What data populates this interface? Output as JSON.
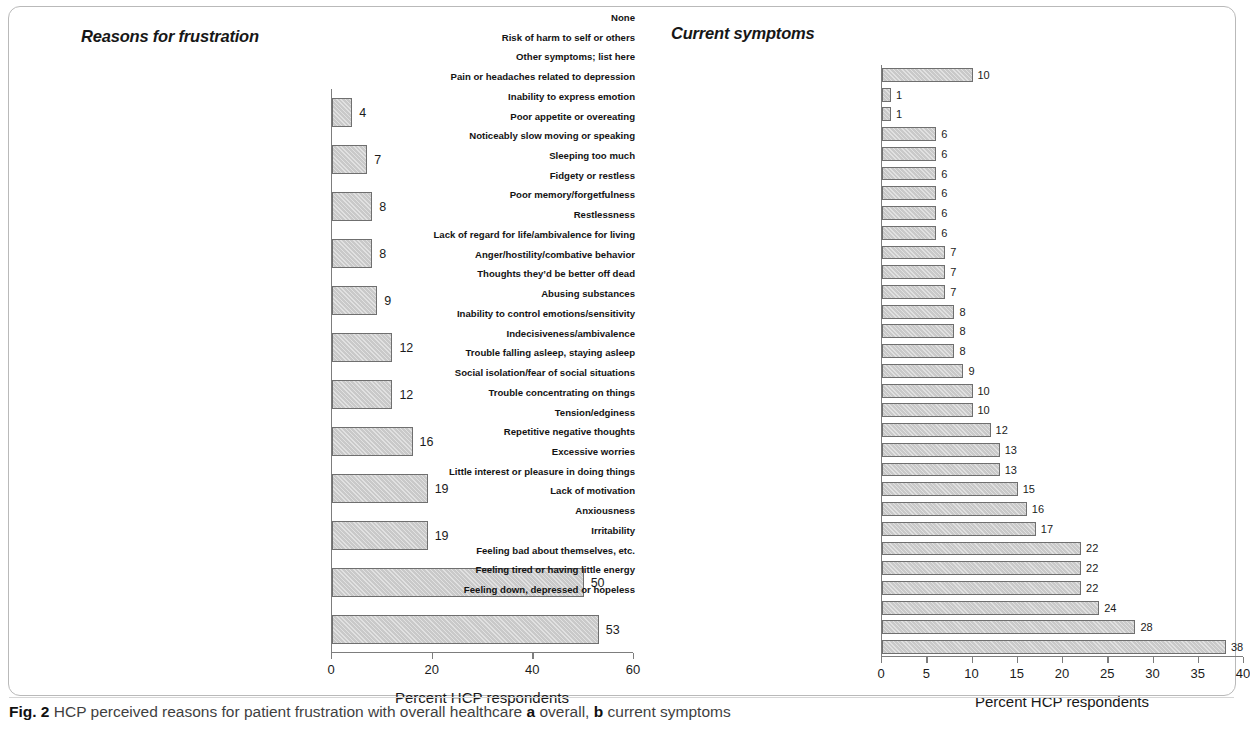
{
  "figure": {
    "caption_number": "Fig. 2",
    "caption_text": "HCP perceived reasons for patient frustration with overall healthcare",
    "caption_sub_a": "a",
    "caption_sub_a_text": "overall,",
    "caption_sub_b": "b",
    "caption_sub_b_text": "current symptoms"
  },
  "chart_data": [
    {
      "type": "bar",
      "orientation": "horizontal",
      "panel": "a",
      "title": "Reasons for frustration",
      "xlabel": "Percent HCP respondents",
      "ylabel": "",
      "xlim": [
        0,
        60
      ],
      "xticks": [
        0,
        20,
        40,
        60
      ],
      "grid": false,
      "legend": "none",
      "bar_color": "#c9c9c9",
      "bar_border_color": "#6f6f6f",
      "categories": [
        "Other",
        "Not being able to get their treatment",
        "Length of time until this patient actually got treatment",
        "Not seeing sufficiently senior/ specialized medical professionals",
        "Having to transition from a general practice doctor to a specialist",
        "Length of time before treatment changed once reported change needed",
        "Insufficient frequency of appointments",
        "Length of time to get an appointment",
        "Having to change treatments",
        "Their medication regimen",
        "Treatment issues (side effects, lack of efficacy, etc.)",
        "The impact their depression has on this patient’s life"
      ],
      "values": [
        4,
        7,
        8,
        8,
        9,
        12,
        12,
        16,
        19,
        19,
        50,
        53
      ]
    },
    {
      "type": "bar",
      "orientation": "horizontal",
      "panel": "b",
      "title": "Current symptoms",
      "xlabel": "Percent HCP respondents",
      "ylabel": "",
      "xlim": [
        0,
        40
      ],
      "xticks": [
        0,
        5,
        10,
        15,
        20,
        25,
        30,
        35,
        40
      ],
      "grid": false,
      "legend": "none",
      "bar_color": "#c9c9c9",
      "bar_border_color": "#6f6f6f",
      "categories": [
        "None",
        "Risk of harm to self or others",
        "Other symptoms; list here",
        "Pain or headaches related to depression",
        "Inability to express emotion",
        "Poor appetite or overeating",
        "Noticeably slow moving or speaking",
        "Sleeping too much",
        "Fidgety or restless",
        "Poor memory/forgetfulness",
        "Restlessness",
        "Lack of regard for life/ambivalence for living",
        "Anger/hostility/combative behavior",
        "Thoughts they’d be better off dead",
        "Abusing substances",
        "Inability to control emotions/sensitivity",
        "Indecisiveness/ambivalence",
        "Trouble falling asleep, staying asleep",
        "Social isolation/fear of social situations",
        "Trouble concentrating on things",
        "Tension/edginess",
        "Repetitive negative thoughts",
        "Excessive worries",
        "Little interest or pleasure in doing things",
        "Lack of motivation",
        "Anxiousness",
        "Irritability",
        "Feeling bad about themselves, etc.",
        "Feeling tired or having little energy",
        "Feeling down, depressed or hopeless"
      ],
      "values": [
        10,
        1,
        1,
        6,
        6,
        6,
        6,
        6,
        6,
        7,
        7,
        7,
        8,
        8,
        8,
        9,
        10,
        10,
        12,
        13,
        13,
        15,
        16,
        17,
        22,
        22,
        22,
        24,
        28,
        38
      ]
    }
  ]
}
